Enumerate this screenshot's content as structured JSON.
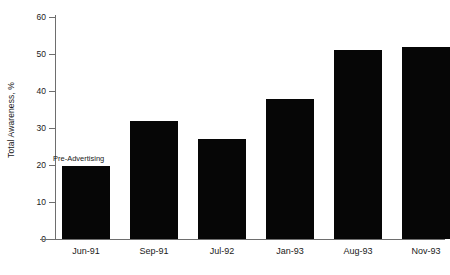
{
  "chart_data": {
    "type": "bar",
    "title": "",
    "xlabel": "",
    "ylabel": "Total Awareness, %",
    "categories": [
      "Jun-91",
      "Sep-91",
      "Jul-92",
      "Jan-93",
      "Aug-93",
      "Nov-93"
    ],
    "values": [
      19.7,
      32.0,
      27.0,
      37.8,
      51.0,
      51.8
    ],
    "ylim": [
      0,
      60
    ],
    "yticks": [
      0,
      10,
      20,
      30,
      40,
      50,
      60
    ],
    "ytick_labels": [
      "0",
      "10",
      "20",
      "30",
      "40",
      "50",
      "60"
    ],
    "grid": false,
    "legend": "none",
    "bar_color": "#060606",
    "axis_color": "#6e6e6e",
    "background_color": "#ffffff",
    "annotations": [
      {
        "text": "Pre-Advertising",
        "category": "Jun-91",
        "value": 19.7,
        "position": "above-bar"
      }
    ]
  },
  "axis": {
    "y_title": "Total Awareness, %"
  }
}
